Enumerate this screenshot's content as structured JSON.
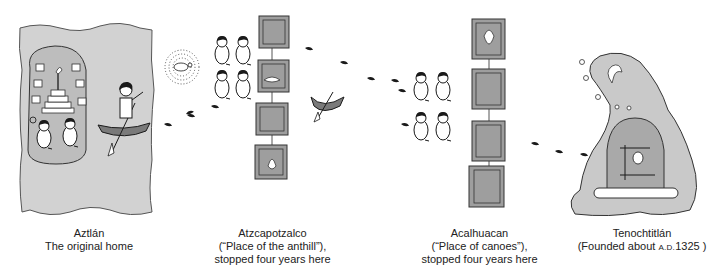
{
  "figure": {
    "stops": [
      {
        "id": "aztlan",
        "name": "Aztlán",
        "line2": "The original home"
      },
      {
        "id": "atzcapotzalco",
        "name": "Atzcapotzalco",
        "line2": "(“Place of the anthill”),",
        "line3": "stopped four years here"
      },
      {
        "id": "acalhuacan",
        "name": "Acalhuacan",
        "line2": "(“Place of canoes”),",
        "line3": "stopped four years here"
      },
      {
        "id": "tenochtitlan",
        "name": "Tenochtitlán",
        "line2_prefix": "(Founded about ",
        "line2_era": "A.D.",
        "line2_year": "1325 )"
      }
    ],
    "colors": {
      "panel_gray": "#c9c9c9",
      "glyph_gray": "#9e9e9e",
      "canoe": "#7a7a7a",
      "ink": "#1a1a1a",
      "background": "#ffffff"
    }
  }
}
